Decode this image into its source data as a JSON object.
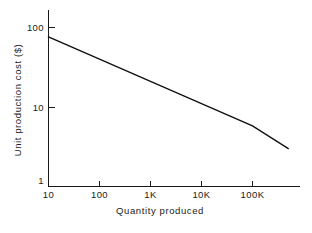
{
  "chart_data": {
    "type": "line",
    "title": "",
    "subtitle": "",
    "xlabel": "Quantity produced",
    "ylabel": "Unit production cost ($)",
    "xscale": "log",
    "yscale": "log",
    "xlim": [
      10,
      500000
    ],
    "ylim": [
      1,
      150
    ],
    "grid": false,
    "legend": null,
    "xticks": [
      {
        "value": 10,
        "label": "10"
      },
      {
        "value": 100,
        "label": "100"
      },
      {
        "value": 1000,
        "label": "1K"
      },
      {
        "value": 10000,
        "label": "10K"
      },
      {
        "value": 100000,
        "label": "100K"
      }
    ],
    "yticks": [
      {
        "value": 1,
        "label": "1"
      },
      {
        "value": 10,
        "label": "10"
      },
      {
        "value": 100,
        "label": "100"
      }
    ],
    "series": [
      {
        "name": "Unit production cost",
        "color": "#111111",
        "x": [
          10,
          100,
          1000,
          10000,
          100000,
          500000
        ],
        "values": [
          76,
          40,
          21,
          11,
          5.8,
          3.0
        ]
      }
    ],
    "annotations": []
  },
  "axes": {
    "y_title": "Unit production cost ($)",
    "x_title": "Quantity produced"
  },
  "labels": {
    "y_100": "100",
    "y_10": "10",
    "y_1": "1",
    "x_10": "10",
    "x_100": "100",
    "x_1k": "1K",
    "x_10k": "10K",
    "x_100k": "100K"
  },
  "colors": {
    "background": "#ffffff",
    "ink": "#1a1a1a",
    "line": "#111111"
  }
}
